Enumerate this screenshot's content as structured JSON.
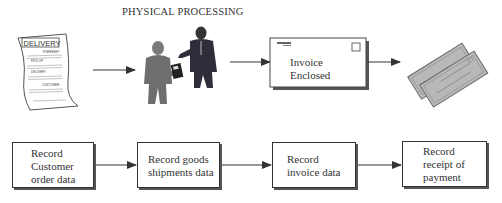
{
  "title": "PHYSICAL PROCESSING",
  "physical_flow": [
    {
      "id": "delivery-document",
      "icon": "delivery-document-icon",
      "label": "DELIVERY",
      "fields": [
        "P.NEREBEY",
        "PICK UP :",
        "DELIVERY :",
        "CUSTOMER :"
      ]
    },
    {
      "id": "goods-handover",
      "icon": "people-handover-icon"
    },
    {
      "id": "invoice-envelope",
      "icon": "envelope-icon",
      "text_line1": "Invoice",
      "text_line2": "Enclosed"
    },
    {
      "id": "payment-checks",
      "icon": "checks-icon"
    }
  ],
  "data_flow": [
    {
      "id": "record-customer-order",
      "line1": "Record",
      "line2": "Customer",
      "line3": "order data"
    },
    {
      "id": "record-goods-shipments",
      "line1": "Record goods",
      "line2": "shipments data"
    },
    {
      "id": "record-invoice",
      "line1": "Record",
      "line2": "invoice data"
    },
    {
      "id": "record-payment",
      "line1": "Record",
      "line2": "receipt of",
      "line3": "payment"
    }
  ],
  "colors": {
    "line": "#333333",
    "figure_light": "#6e6e6e",
    "figure_dark": "#2e2e3a",
    "check_fill": "#b8b8b8"
  }
}
